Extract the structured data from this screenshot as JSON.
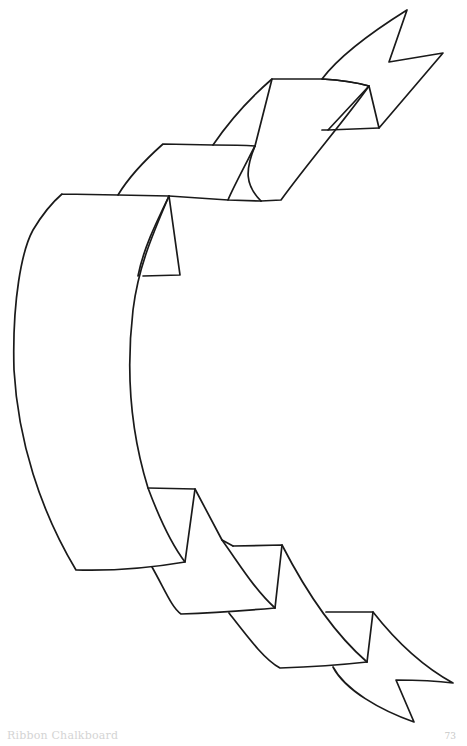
{
  "page": {
    "illustration": {
      "subject": "ribbon-banner-line-art",
      "stroke_color": "#1a1a1a",
      "background": "#ffffff"
    },
    "footer": {
      "title": "Ribbon Chalkboard",
      "page_number": "73"
    }
  }
}
